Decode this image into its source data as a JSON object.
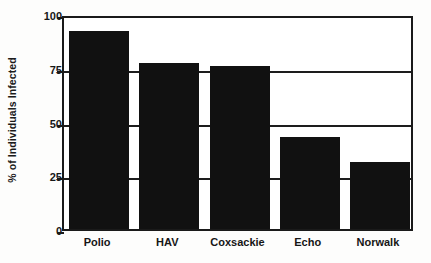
{
  "chart_data": {
    "type": "bar",
    "title": "",
    "subtitle": "",
    "xlabel": "",
    "ylabel": "% of Individuals Infected",
    "categories": [
      "Polio",
      "HAV",
      "Coxsackie",
      "Echo",
      "Norwalk"
    ],
    "values": [
      92,
      77,
      76,
      43,
      31
    ],
    "series": [
      {
        "name": "% of Individuals Infected",
        "values": [
          92,
          77,
          76,
          43,
          31
        ]
      }
    ],
    "ylim": [
      0,
      100
    ],
    "yticks": [
      0,
      25,
      50,
      75,
      100
    ],
    "ytick_labels": [
      "0",
      "25",
      "50",
      "75",
      "100"
    ],
    "grid": true,
    "grid_axis": "y",
    "legend": false,
    "legend_position": "none",
    "bar_color": "#111111",
    "axis_color": "#1a1a1a",
    "background_color": "#ffffff",
    "annotations": []
  },
  "figure": {
    "frame_visible": true,
    "style": "scanned-monochrome"
  }
}
